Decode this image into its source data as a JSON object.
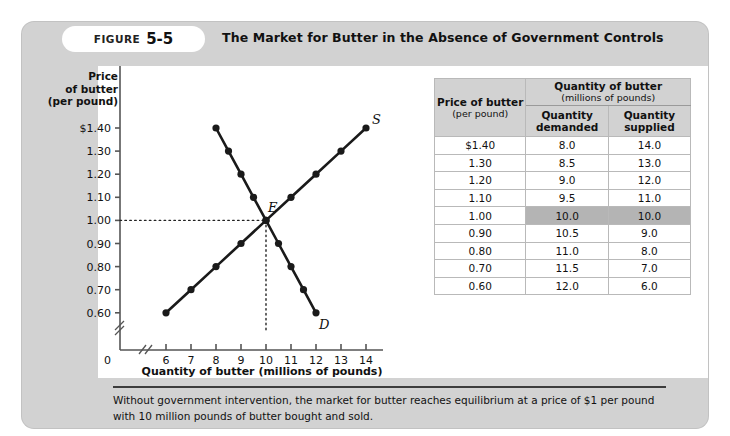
{
  "figure": {
    "label": "FIGURE",
    "number": "5-5",
    "title": "The Market for Butter in the Absence of Government Controls",
    "caption": "Without government intervention, the market for butter reaches equilibrium at a price of $1 per pound with 10 million pounds of butter bought and sold."
  },
  "table": {
    "price_header_line1": "Price of butter",
    "price_header_line2": "(per pound)",
    "group_header_line1": "Quantity of butter",
    "group_header_line2": "(millions of pounds)",
    "col_demanded_line1": "Quantity",
    "col_demanded_line2": "demanded",
    "col_supplied_line1": "Quantity",
    "col_supplied_line2": "supplied",
    "rows": [
      {
        "price": "$1.40",
        "demanded": "8.0",
        "supplied": "14.0",
        "highlight": false
      },
      {
        "price": "1.30",
        "demanded": "8.5",
        "supplied": "13.0",
        "highlight": false
      },
      {
        "price": "1.20",
        "demanded": "9.0",
        "supplied": "12.0",
        "highlight": false
      },
      {
        "price": "1.10",
        "demanded": "9.5",
        "supplied": "11.0",
        "highlight": false
      },
      {
        "price": "1.00",
        "demanded": "10.0",
        "supplied": "10.0",
        "highlight": true
      },
      {
        "price": "0.90",
        "demanded": "10.5",
        "supplied": "9.0",
        "highlight": false
      },
      {
        "price": "0.80",
        "demanded": "11.0",
        "supplied": "8.0",
        "highlight": false
      },
      {
        "price": "0.70",
        "demanded": "11.5",
        "supplied": "7.0",
        "highlight": false
      },
      {
        "price": "0.60",
        "demanded": "12.0",
        "supplied": "6.0",
        "highlight": false
      }
    ]
  },
  "chart_data": {
    "type": "line",
    "title": "The Market for Butter in the Absence of Government Controls",
    "xlabel": "Quantity of butter (millions of pounds)",
    "ylabel_line1": "Price",
    "ylabel_line2": "of butter",
    "ylabel_line3": "(per pound)",
    "x_tick_labels": [
      "6",
      "7",
      "8",
      "9",
      "10",
      "11",
      "12",
      "13",
      "14"
    ],
    "x_ticks": [
      6,
      7,
      8,
      9,
      10,
      11,
      12,
      13,
      14
    ],
    "y_tick_labels": [
      "$1.40",
      "1.30",
      "1.20",
      "1.10",
      "1.00",
      "0.90",
      "0.80",
      "0.70",
      "0.60"
    ],
    "y_ticks": [
      1.4,
      1.3,
      1.2,
      1.1,
      1.0,
      0.9,
      0.8,
      0.7,
      0.6
    ],
    "origin_label": "0",
    "xlim": [
      6,
      14
    ],
    "ylim": [
      0.6,
      1.4
    ],
    "axis_break_x": true,
    "axis_break_y": true,
    "grid": false,
    "series": [
      {
        "name": "Demand",
        "label": "D",
        "points": [
          {
            "x": 8.0,
            "y": 1.4
          },
          {
            "x": 8.5,
            "y": 1.3
          },
          {
            "x": 9.0,
            "y": 1.2
          },
          {
            "x": 9.5,
            "y": 1.1
          },
          {
            "x": 10.0,
            "y": 1.0
          },
          {
            "x": 10.5,
            "y": 0.9
          },
          {
            "x": 11.0,
            "y": 0.8
          },
          {
            "x": 11.5,
            "y": 0.7
          },
          {
            "x": 12.0,
            "y": 0.6
          }
        ]
      },
      {
        "name": "Supply",
        "label": "S",
        "points": [
          {
            "x": 6.0,
            "y": 0.6
          },
          {
            "x": 7.0,
            "y": 0.7
          },
          {
            "x": 8.0,
            "y": 0.8
          },
          {
            "x": 9.0,
            "y": 0.9
          },
          {
            "x": 10.0,
            "y": 1.0
          },
          {
            "x": 11.0,
            "y": 1.1
          },
          {
            "x": 12.0,
            "y": 1.2
          },
          {
            "x": 13.0,
            "y": 1.3
          },
          {
            "x": 14.0,
            "y": 1.4
          }
        ]
      }
    ],
    "annotations": [
      {
        "name": "equilibrium",
        "label": "E",
        "x": 10.0,
        "y": 1.0
      }
    ],
    "colors": {
      "curve": "#1a1a1a",
      "axis": "#555555",
      "panel": "#d2d2d2",
      "plot_background": "#ffffff",
      "highlight": "#b4b4b4"
    }
  }
}
